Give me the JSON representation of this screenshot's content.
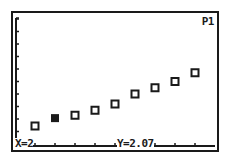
{
  "screen": {
    "plot_indicator": "P1",
    "trace": {
      "x_label": "X=2",
      "y_label": "Y=2.07",
      "x": 2,
      "y": 2.07,
      "point_index": 1
    }
  },
  "colors": {
    "ink": "#1a1a1a",
    "background": "#ffffff"
  },
  "chart_data": {
    "type": "scatter",
    "title": "",
    "xlabel": "",
    "ylabel": "",
    "x": [
      1,
      2,
      3,
      4,
      5,
      6,
      7,
      8,
      9
    ],
    "values": [
      1.44,
      2.07,
      2.3,
      2.7,
      3.2,
      4.0,
      4.5,
      5.0,
      5.7
    ],
    "series": [
      {
        "name": "P1",
        "x": [
          1,
          2,
          3,
          4,
          5,
          6,
          7,
          8,
          9
        ],
        "values": [
          1.44,
          2.07,
          2.3,
          2.7,
          3.2,
          4.0,
          4.5,
          5.0,
          5.7
        ],
        "marker": "square"
      }
    ],
    "xlim": [
      0,
      10
    ],
    "ylim": [
      0,
      10
    ],
    "x_ticks": [
      1,
      2,
      3,
      4,
      5,
      6,
      7,
      8,
      9
    ],
    "y_ticks": [
      1,
      2,
      3,
      4,
      5,
      6,
      7,
      8,
      9,
      10
    ],
    "grid": false,
    "legend": "none",
    "annotations": [
      "P1",
      "X=2",
      "Y=2.07"
    ]
  }
}
